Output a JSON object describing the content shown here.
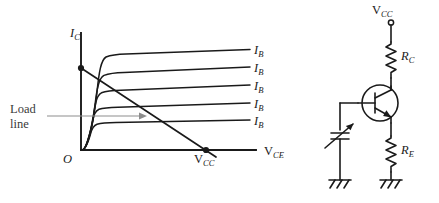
{
  "figure": {
    "background_color": "#ffffff",
    "ink_color": "#1a1a1a",
    "pointer_color": "#8d8d8d"
  },
  "graph": {
    "y_axis_label": "I",
    "y_axis_sub": "C",
    "x_axis_label": "V",
    "x_axis_sub": "CE",
    "origin_label": "O",
    "vcc_label": "V",
    "vcc_sub": "CC",
    "loadline_label_line1": "Load",
    "loadline_label_line2": "line",
    "curve_labels": [
      {
        "base": "I",
        "sub": "B"
      },
      {
        "base": "I",
        "sub": "B"
      },
      {
        "base": "I",
        "sub": "B"
      },
      {
        "base": "I",
        "sub": "B"
      },
      {
        "base": "I",
        "sub": "B"
      }
    ]
  },
  "circuit": {
    "supply_label": "V",
    "supply_sub": "CC",
    "collector_resistor_label": "R",
    "collector_resistor_sub": "C",
    "emitter_resistor_label": "R",
    "emitter_resistor_sub": "E",
    "transistor_type": "npn-bjt",
    "input_element": "variable-capacitor",
    "ground_count": 2
  },
  "chart_data": {
    "type": "line",
    "xlabel": "V_CE",
    "ylabel": "I_C",
    "grid": false,
    "legend_position": "right-of-curves",
    "axis_origin_label": "O",
    "annotations": [
      {
        "text": "Load line",
        "target": "dc-load-line"
      },
      {
        "text": "V_CC",
        "at": "x-intercept of load line"
      }
    ],
    "load_line": {
      "y_intercept_px": [
        81,
        68
      ],
      "x_intercept_px": [
        206,
        148
      ],
      "extends_to_px": [
        216,
        157
      ]
    },
    "series": [
      {
        "name": "I_B",
        "knee_x": 96,
        "saturation_level_px": 54,
        "start_px": [
          82,
          150
        ]
      },
      {
        "name": "I_B",
        "knee_x": 94,
        "saturation_level_px": 74,
        "start_px": [
          82,
          150
        ]
      },
      {
        "name": "I_B",
        "knee_x": 92,
        "saturation_level_px": 92,
        "start_px": [
          82,
          150
        ]
      },
      {
        "name": "I_B",
        "knee_x": 90,
        "saturation_level_px": 110,
        "start_px": [
          82,
          150
        ]
      },
      {
        "name": "I_B",
        "knee_x": 88,
        "saturation_level_px": 125,
        "start_px": [
          82,
          150
        ]
      }
    ]
  }
}
